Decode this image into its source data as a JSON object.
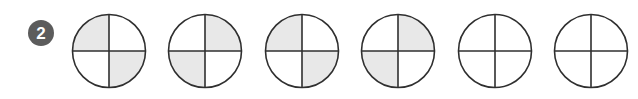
{
  "worksheet": {
    "item_number_badge": {
      "label": "2",
      "badge_color": "#5c5c5c",
      "text_color": "#ffffff"
    },
    "background_color": "#ffffff",
    "stroke_color": "#2f2f2f",
    "shade_color": "#e8e8e8",
    "unshaded_color": "#ffffff",
    "figures": [
      {
        "name": "fraction-circle-1",
        "parts_total": 4,
        "parts_shaded": 2,
        "fraction": "2/4",
        "shaded_quadrants": [
          "top-left",
          "bottom-right"
        ],
        "quadrants": {
          "top-left": "shaded",
          "top-right": "unshaded",
          "bottom-right": "shaded",
          "bottom-left": "unshaded"
        }
      },
      {
        "name": "fraction-circle-2",
        "parts_total": 4,
        "parts_shaded": 2,
        "fraction": "2/4",
        "shaded_quadrants": [
          "top-right",
          "bottom-left"
        ],
        "quadrants": {
          "top-left": "unshaded",
          "top-right": "shaded",
          "bottom-right": "unshaded",
          "bottom-left": "shaded"
        }
      },
      {
        "name": "fraction-circle-3",
        "parts_total": 4,
        "parts_shaded": 2,
        "fraction": "2/4",
        "shaded_quadrants": [
          "top-left",
          "bottom-right"
        ],
        "quadrants": {
          "top-left": "shaded",
          "top-right": "unshaded",
          "bottom-right": "shaded",
          "bottom-left": "unshaded"
        }
      },
      {
        "name": "fraction-circle-4",
        "parts_total": 4,
        "parts_shaded": 2,
        "fraction": "2/4",
        "shaded_quadrants": [
          "top-right",
          "bottom-left"
        ],
        "quadrants": {
          "top-left": "unshaded",
          "top-right": "shaded",
          "bottom-right": "unshaded",
          "bottom-left": "shaded"
        }
      },
      {
        "name": "fraction-circle-5",
        "parts_total": 4,
        "parts_shaded": 0,
        "fraction": "0/4",
        "shaded_quadrants": [],
        "quadrants": {
          "top-left": "unshaded",
          "top-right": "unshaded",
          "bottom-right": "unshaded",
          "bottom-left": "unshaded"
        }
      },
      {
        "name": "fraction-circle-6",
        "parts_total": 4,
        "parts_shaded": 0,
        "fraction": "0/4",
        "shaded_quadrants": [],
        "quadrants": {
          "top-left": "unshaded",
          "top-right": "unshaded",
          "bottom-right": "unshaded",
          "bottom-left": "unshaded"
        }
      }
    ]
  }
}
